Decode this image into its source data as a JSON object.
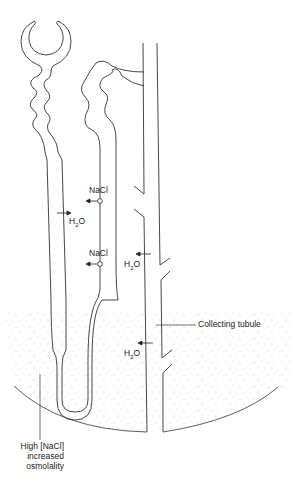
{
  "diagram": {
    "type": "nephron-countercurrent",
    "colors": {
      "line": "#333333",
      "stipple": "#9a9a9a",
      "background": "#ffffff"
    },
    "labels": {
      "nacl_upper": "NaCl",
      "h2o_left": "H",
      "h2o_left_sub": "2",
      "h2o_left_tail": "O",
      "nacl_lower": "NaCl",
      "h2o_mid": "H",
      "h2o_mid_sub": "2",
      "h2o_mid_tail": "O",
      "h2o_lower": "H",
      "h2o_lower_sub": "2",
      "h2o_lower_tail": "O",
      "collecting_tubule": "Collecting tubule",
      "medulla_line1": "High [NaCl]",
      "medulla_line2": "increased",
      "medulla_line3": "osmolality"
    },
    "arrows": [
      {
        "name": "nacl-out-upper",
        "direction": "left"
      },
      {
        "name": "h2o-out-descending",
        "direction": "right"
      },
      {
        "name": "nacl-out-lower",
        "direction": "left"
      },
      {
        "name": "h2o-out-collecting-mid",
        "direction": "left"
      },
      {
        "name": "h2o-out-collecting-lower",
        "direction": "left"
      }
    ]
  }
}
